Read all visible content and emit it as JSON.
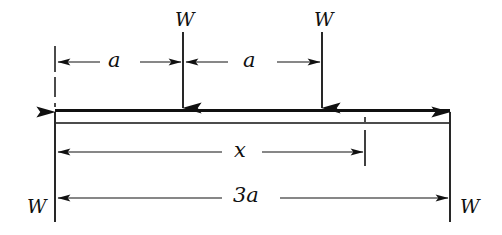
{
  "figure": {
    "type": "beam-load-diagram",
    "stroke_color": "#101010",
    "background_color": "#ffffff"
  },
  "labels": {
    "load_left": "W",
    "load_right": "W",
    "reaction_left": "W",
    "reaction_right": "W",
    "dim_a_left": "a",
    "dim_a_right": "a",
    "dim_x": "x",
    "dim_3a": "3a"
  },
  "geometry": {
    "beam": {
      "left_x": 55,
      "right_x": 450,
      "top_y": 110,
      "bottom_y": 123,
      "span_label": "3a"
    },
    "loads": [
      {
        "name": "load-W-1",
        "x": 183,
        "label": "W",
        "direction": "down",
        "start_y": 32,
        "end_y": 110
      },
      {
        "name": "load-W-2",
        "x": 322,
        "label": "W",
        "direction": "down",
        "start_y": 32,
        "end_y": 110
      }
    ],
    "reactions": [
      {
        "name": "reaction-W-left",
        "x": 55,
        "label": "W",
        "direction": "up",
        "start_y": 222,
        "end_y": 110
      },
      {
        "name": "reaction-W-right",
        "x": 450,
        "label": "W",
        "direction": "up",
        "start_y": 222,
        "end_y": 110
      }
    ],
    "dimensions": [
      {
        "name": "dim-a-left",
        "label": "a",
        "y": 62,
        "from_x": 56,
        "to_x": 182,
        "label_x": 115
      },
      {
        "name": "dim-a-right",
        "label": "a",
        "y": 62,
        "from_x": 184,
        "to_x": 321,
        "label_x": 250
      },
      {
        "name": "dim-x",
        "label": "x",
        "y": 152,
        "from_x": 56,
        "to_x": 364,
        "label_x": 233
      },
      {
        "name": "dim-3a",
        "label": "3a",
        "y": 198,
        "from_x": 56,
        "to_x": 449,
        "label_x": 243
      }
    ],
    "extension_lines": [
      {
        "name": "ext-line-left-support",
        "x": 55,
        "from_y": 46,
        "to_y": 107,
        "style": "dashed"
      },
      {
        "name": "ext-line-section-x",
        "x": 365,
        "from_y": 117,
        "to_y": 166,
        "style": "dashed-top"
      }
    ]
  }
}
